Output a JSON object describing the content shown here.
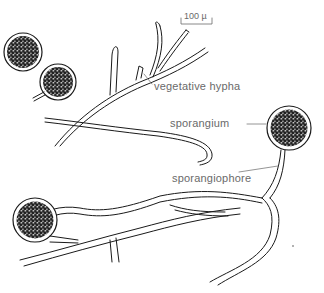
{
  "figure": {
    "scale_bar": {
      "label": "100 µ"
    },
    "labels": {
      "vegetative_hypha": "vegetative   hypha",
      "sporangium": "sporangium",
      "sporangiophore": "sporangiophore"
    },
    "colors": {
      "line": "#1a1a1a",
      "label": "#6a6a6a",
      "fill_dark": "#222222",
      "fill_light": "#cfcfcf"
    }
  }
}
